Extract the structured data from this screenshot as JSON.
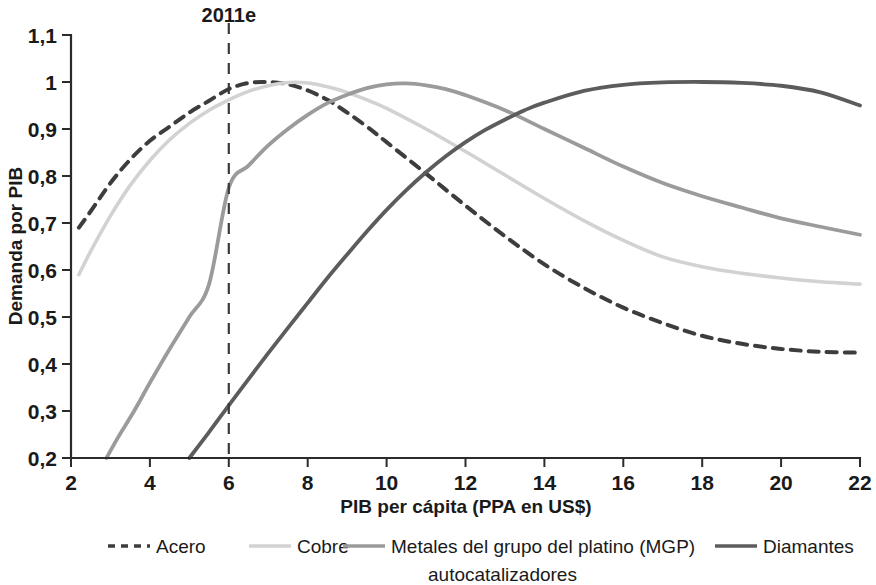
{
  "chart_data": {
    "type": "line",
    "title": "",
    "xlabel": "PIB per cápita (PPA en US$)",
    "ylabel": "Demanda por PIB",
    "xlim": [
      2,
      22
    ],
    "ylim": [
      0.2,
      1.1
    ],
    "grid": false,
    "legend_position": "bottom",
    "x_ticks": [
      "2",
      "4",
      "6",
      "8",
      "10",
      "12",
      "14",
      "16",
      "18",
      "20",
      "22"
    ],
    "x_tick_values": [
      2,
      4,
      6,
      8,
      10,
      12,
      14,
      16,
      18,
      20,
      22
    ],
    "y_ticks": [
      "0,2",
      "0,3",
      "0,4",
      "0,5",
      "0,6",
      "0,7",
      "0,8",
      "0,9",
      "1",
      "1,1"
    ],
    "y_tick_values": [
      0.2,
      0.3,
      0.4,
      0.5,
      0.6,
      0.7,
      0.8,
      0.9,
      1.0,
      1.1
    ],
    "annotations": [
      {
        "name": "marker-2011e",
        "label": "2011e",
        "x": 6,
        "y_top": 1.1,
        "y_bottom": 0.2,
        "style": "dashed-vertical"
      }
    ],
    "series": [
      {
        "name": "Acero",
        "color": "#3d3d3d",
        "style": "dashed",
        "width": 4.0,
        "x": [
          2.2,
          2.5,
          3,
          3.5,
          4,
          4.5,
          5,
          5.5,
          6,
          6.5,
          7,
          7.5,
          8,
          8.5,
          9,
          9.5,
          10,
          11,
          12,
          13,
          14,
          15,
          16,
          17,
          18,
          19,
          20,
          21,
          22
        ],
        "values": [
          0.69,
          0.725,
          0.785,
          0.835,
          0.875,
          0.905,
          0.935,
          0.96,
          0.985,
          0.998,
          1.0,
          0.995,
          0.982,
          0.962,
          0.935,
          0.905,
          0.872,
          0.805,
          0.737,
          0.672,
          0.612,
          0.562,
          0.52,
          0.487,
          0.46,
          0.443,
          0.432,
          0.426,
          0.424
        ]
      },
      {
        "name": "Cobre",
        "color": "#d2d2d2",
        "style": "solid",
        "width": 3.6,
        "x": [
          2.2,
          2.5,
          3,
          3.5,
          4,
          4.5,
          5,
          5.5,
          6,
          6.5,
          7,
          7.5,
          8,
          8.5,
          9,
          9.5,
          10,
          11,
          12,
          13,
          14,
          15,
          16,
          17,
          18,
          19,
          20,
          21,
          22
        ],
        "values": [
          0.59,
          0.64,
          0.715,
          0.78,
          0.833,
          0.877,
          0.912,
          0.94,
          0.962,
          0.98,
          0.992,
          0.999,
          0.998,
          0.99,
          0.978,
          0.962,
          0.944,
          0.9,
          0.852,
          0.802,
          0.752,
          0.705,
          0.663,
          0.628,
          0.607,
          0.593,
          0.583,
          0.575,
          0.57
        ]
      },
      {
        "name": "Metales del grupo del platino (MGP) autocatalizadores",
        "color": "#9b9b9b",
        "style": "solid",
        "width": 3.8,
        "x": [
          2.9,
          3.2,
          3.6,
          4,
          4.5,
          5,
          5.5,
          6,
          6.5,
          7,
          7.5,
          8,
          8.5,
          9,
          9.5,
          10,
          10.5,
          11,
          11.5,
          12,
          13,
          14,
          15,
          16,
          17,
          18,
          19,
          20,
          21,
          22
        ],
        "values": [
          0.2,
          0.245,
          0.3,
          0.36,
          0.432,
          0.5,
          0.57,
          0.775,
          0.822,
          0.865,
          0.9,
          0.93,
          0.955,
          0.973,
          0.987,
          0.995,
          0.997,
          0.993,
          0.985,
          0.972,
          0.94,
          0.9,
          0.86,
          0.82,
          0.785,
          0.757,
          0.733,
          0.71,
          0.692,
          0.675
        ]
      },
      {
        "name": "Diamantes",
        "color": "#5c5c5c",
        "style": "solid",
        "width": 3.8,
        "x": [
          5,
          5.5,
          6,
          6.5,
          7,
          7.5,
          8,
          8.5,
          9,
          9.5,
          10,
          10.5,
          11,
          11.5,
          12,
          12.5,
          13,
          13.5,
          14,
          15,
          16,
          17,
          18,
          19,
          20,
          21,
          22
        ],
        "values": [
          0.2,
          0.255,
          0.312,
          0.368,
          0.423,
          0.477,
          0.53,
          0.583,
          0.633,
          0.682,
          0.728,
          0.77,
          0.808,
          0.842,
          0.872,
          0.898,
          0.92,
          0.94,
          0.956,
          0.981,
          0.994,
          0.999,
          1.0,
          0.998,
          0.992,
          0.978,
          0.95
        ]
      }
    ]
  },
  "legend": {
    "items": [
      {
        "label": "Acero",
        "color": "#3d3d3d",
        "style": "dashed"
      },
      {
        "label": "Cobre",
        "color": "#d2d2d2",
        "style": "solid"
      },
      {
        "label": "Metales del grupo del platino (MGP)",
        "label2": "autocatalizadores",
        "color": "#9b9b9b",
        "style": "solid"
      },
      {
        "label": "Diamantes",
        "color": "#5c5c5c",
        "style": "solid"
      }
    ]
  },
  "colors": {
    "axis": "#2b2b2b",
    "text": "#1a1a1a",
    "background": "#ffffff",
    "marker": "#3a3a3a"
  }
}
